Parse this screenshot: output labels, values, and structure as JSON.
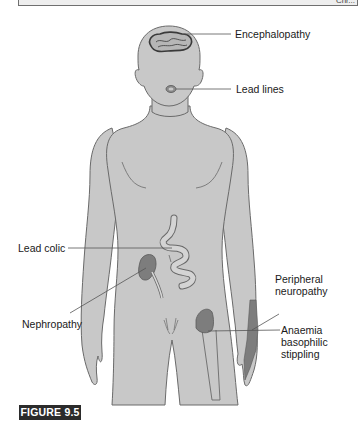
{
  "header_box": {
    "text": "Chr..."
  },
  "figure": {
    "label": "FIGURE 9.5",
    "colors": {
      "skin": "#c8c8c8",
      "outline": "#6a6a6a",
      "lesion": "#7d7d7d",
      "brain_outline": "#3a3a3a"
    },
    "annotations": [
      {
        "id": "encephalopathy",
        "text": "Encephalopathy",
        "target": "brain"
      },
      {
        "id": "lead_lines",
        "text": "Lead lines",
        "target": "gums"
      },
      {
        "id": "lead_colic",
        "text": "Lead colic",
        "target": "intestine"
      },
      {
        "id": "nephropathy",
        "text": "Nephropathy",
        "target": "kidney"
      },
      {
        "id": "peripheral_neuropathy",
        "text": "Peripheral neuropathy",
        "line1": "Peripheral",
        "line2": "neuropathy",
        "target": "wrist"
      },
      {
        "id": "anaemia",
        "text": "Anaemia basophilic stippling",
        "line1": "Anaemia",
        "line2": "basophilic",
        "line3": "stippling",
        "target": "bone marrow (femur)"
      }
    ]
  }
}
